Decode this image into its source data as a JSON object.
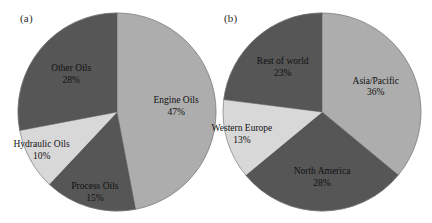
{
  "figure": {
    "background_color": "#ffffff",
    "panels": [
      {
        "tag": "(a)",
        "slices": [
          {
            "label": "Engine Oils",
            "pct_text": "47%",
            "value": 47,
            "color": "#ADADAD"
          },
          {
            "label": "Process Oils",
            "pct_text": "15%",
            "value": 15,
            "color": "#565656"
          },
          {
            "label": "Hydraulic Oils",
            "pct_text": "10%",
            "value": 10,
            "color": "#D8D8D8"
          },
          {
            "label": "Other Oils",
            "pct_text": "28%",
            "value": 28,
            "color": "#565656"
          }
        ]
      },
      {
        "tag": "(b)",
        "slices": [
          {
            "label": "Asia/Pacific",
            "pct_text": "36%",
            "value": 36,
            "color": "#ADADAD"
          },
          {
            "label": "North America",
            "pct_text": "28%",
            "value": 28,
            "color": "#565656"
          },
          {
            "label": "Western Europe",
            "pct_text": "13%",
            "value": 13,
            "color": "#D8D8D8"
          },
          {
            "label": "Rest of world",
            "pct_text": "23%",
            "value": 23,
            "color": "#565656"
          }
        ]
      }
    ]
  },
  "chart_data": [
    {
      "type": "pie",
      "title": "(a)",
      "categories": [
        "Engine Oils",
        "Process Oils",
        "Hydraulic Oils",
        "Other Oils"
      ],
      "values": [
        47,
        15,
        10,
        28
      ],
      "value_labels": [
        "47%",
        "15%",
        "10%",
        "28%"
      ],
      "units": "percent",
      "colors": [
        "#ADADAD",
        "#565656",
        "#D8D8D8",
        "#565656"
      ],
      "start_angle_deg": 0,
      "direction": "clockwise",
      "legend": "none",
      "labels_position": "inside-slice",
      "xlabel": "",
      "ylabel": ""
    },
    {
      "type": "pie",
      "title": "(b)",
      "categories": [
        "Asia/Pacific",
        "North America",
        "Western Europe",
        "Rest of world"
      ],
      "values": [
        36,
        28,
        13,
        23
      ],
      "value_labels": [
        "36%",
        "28%",
        "13%",
        "23%"
      ],
      "units": "percent",
      "colors": [
        "#ADADAD",
        "#565656",
        "#D8D8D8",
        "#565656"
      ],
      "start_angle_deg": 0,
      "direction": "clockwise",
      "legend": "none",
      "labels_position": "inside-slice",
      "xlabel": "",
      "ylabel": ""
    }
  ]
}
